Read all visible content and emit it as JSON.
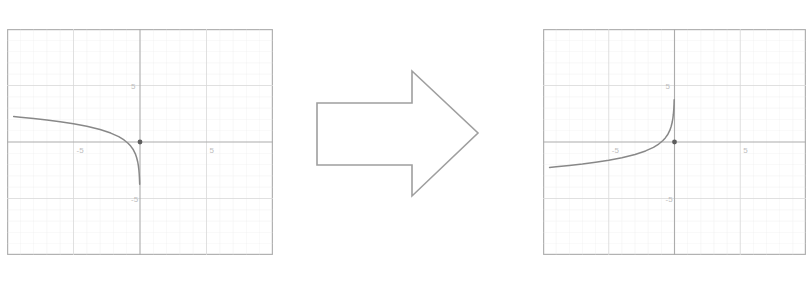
{
  "figure": {
    "background_color": "#ffffff",
    "ink_color": "#8a8a8a",
    "curve_color": "#6f6f6f",
    "grid_color": "#e2e2e2",
    "axis_color": "#9a9a9a",
    "frame_color": "#9a9a9a",
    "point_color": "#3a3a3a"
  },
  "arrow": {
    "name": "right-block-arrow",
    "direction": "right",
    "label": "",
    "stroke_color": "#8a8a8a",
    "fill_color": "#ffffff"
  },
  "chart_data": [
    {
      "type": "line",
      "name": "original-graph",
      "title": "",
      "xlabel": "",
      "ylabel": "",
      "xlim": [
        -10,
        10
      ],
      "ylim": [
        -10,
        10
      ],
      "grid": true,
      "gridlines_x": [
        -5,
        0,
        5
      ],
      "gridlines_y": [
        -5,
        0,
        5
      ],
      "xticks": [
        -5,
        5
      ],
      "yticks": [
        5,
        -5
      ],
      "xtick_labels": [
        "-5",
        "5"
      ],
      "ytick_labels": [
        "5",
        "-5"
      ],
      "legend": "none",
      "annotations": [
        {
          "name": "origin-point",
          "x": 0,
          "y": 0,
          "label": ""
        }
      ],
      "series": [
        {
          "name": "y = -ln(-x)",
          "comment": "decreasing log branch on x<0, plunging to -inf as x -> 0^-",
          "x": [
            -9.5,
            -9.0,
            -8.0,
            -7.0,
            -6.0,
            -5.0,
            -4.0,
            -3.0,
            -2.2,
            -1.6,
            -1.2,
            -0.9,
            -0.7,
            -0.5,
            -0.35,
            -0.25,
            -0.17,
            -0.12,
            -0.085,
            -0.06,
            -0.045,
            -0.035,
            -0.028,
            -0.024
          ],
          "y": [
            2.25,
            2.2,
            2.08,
            1.95,
            1.79,
            1.61,
            1.39,
            1.1,
            0.79,
            0.47,
            0.18,
            -0.11,
            -0.36,
            -0.69,
            -1.05,
            -1.39,
            -1.77,
            -2.12,
            -2.46,
            -2.81,
            -3.1,
            -3.35,
            -3.58,
            -3.73
          ]
        }
      ]
    },
    {
      "type": "line",
      "name": "reflected-graph",
      "title": "",
      "xlabel": "",
      "ylabel": "",
      "xlim": [
        -10,
        10
      ],
      "ylim": [
        -10,
        10
      ],
      "grid": true,
      "gridlines_x": [
        -5,
        0,
        5
      ],
      "gridlines_y": [
        -5,
        0,
        5
      ],
      "xticks": [
        -5,
        5
      ],
      "yticks": [
        5,
        -5
      ],
      "xtick_labels": [
        "-5",
        "5"
      ],
      "ytick_labels": [
        "5",
        "-5"
      ],
      "legend": "none",
      "annotations": [
        {
          "name": "origin-point",
          "x": 0,
          "y": 0,
          "label": ""
        }
      ],
      "series": [
        {
          "name": "y = ln(-x)  (reflection across x-axis)",
          "comment": "same branch on x<0 flipped vertically, soaring to +inf as x -> 0^-",
          "x": [
            -9.5,
            -9.0,
            -8.0,
            -7.0,
            -6.0,
            -5.0,
            -4.0,
            -3.0,
            -2.2,
            -1.6,
            -1.2,
            -0.9,
            -0.7,
            -0.5,
            -0.35,
            -0.25,
            -0.17,
            -0.12,
            -0.085,
            -0.06,
            -0.045,
            -0.035,
            -0.028,
            -0.024
          ],
          "y": [
            -2.25,
            -2.2,
            -2.08,
            -1.95,
            -1.79,
            -1.61,
            -1.39,
            -1.1,
            -0.79,
            -0.47,
            -0.18,
            0.11,
            0.36,
            0.69,
            1.05,
            1.39,
            1.77,
            2.12,
            2.46,
            2.81,
            3.1,
            3.35,
            3.58,
            3.73
          ]
        }
      ]
    }
  ]
}
